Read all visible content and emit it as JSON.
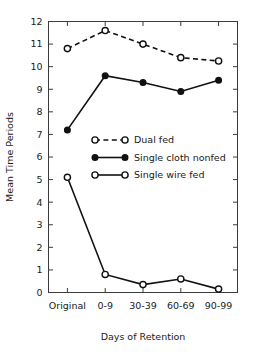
{
  "chart_data": {
    "type": "line",
    "title": "",
    "xlabel": "Days of Retention",
    "ylabel": "Mean Time Periods",
    "categories": [
      "Original",
      "0-9",
      "30-39",
      "60-69",
      "90-99"
    ],
    "ylim": [
      0,
      12
    ],
    "yticks": [
      0,
      1,
      2,
      3,
      4,
      5,
      6,
      7,
      8,
      9,
      10,
      11,
      12
    ],
    "ytick_labels": [
      "0",
      "1",
      "2",
      "3",
      "4",
      "5",
      "6",
      "7",
      "8",
      "9",
      "10",
      "11",
      "12"
    ],
    "grid": false,
    "legend_position": "center",
    "series": [
      {
        "name": "Dual fed",
        "values": [
          10.8,
          11.6,
          11.0,
          10.4,
          10.25
        ],
        "line_style": "dashed",
        "marker": "open-circle",
        "color": "#111111"
      },
      {
        "name": "Single cloth nonfed",
        "values": [
          7.2,
          9.6,
          9.3,
          8.9,
          9.4
        ],
        "line_style": "solid",
        "marker": "filled-circle",
        "color": "#111111"
      },
      {
        "name": "Single wire fed",
        "values": [
          5.1,
          0.8,
          0.35,
          0.6,
          0.15
        ],
        "line_style": "solid",
        "marker": "open-circle",
        "color": "#111111"
      }
    ]
  },
  "legend": {
    "entries": [
      {
        "label": "Dual fed"
      },
      {
        "label": "Single cloth nonfed"
      },
      {
        "label": "Single wire fed"
      }
    ]
  }
}
